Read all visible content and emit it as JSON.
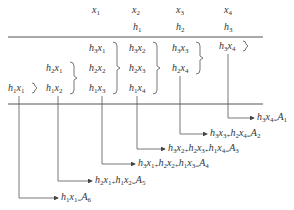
{
  "header": {
    "x_labels": [
      {
        "v": "x",
        "s": "1",
        "left": 92,
        "top": 5
      },
      {
        "v": "x",
        "s": "2",
        "left": 132,
        "top": 5
      },
      {
        "v": "x",
        "s": "3",
        "left": 176,
        "top": 5
      },
      {
        "v": "x",
        "s": "4",
        "left": 224,
        "top": 5
      }
    ],
    "h_labels": [
      {
        "v": "h",
        "s": "1",
        "left": 133,
        "top": 22
      },
      {
        "v": "h",
        "s": "2",
        "left": 176,
        "top": 22
      },
      {
        "v": "h",
        "s": "3",
        "left": 224,
        "top": 22
      }
    ]
  },
  "products": [
    {
      "left": 8,
      "top": 83,
      "items": [
        [
          "h",
          "1",
          "x",
          "1"
        ]
      ]
    },
    {
      "left": 46,
      "top": 63,
      "items": [
        [
          "h",
          "2",
          "x",
          "1"
        ],
        [
          "h",
          "1",
          "x",
          "2"
        ]
      ]
    },
    {
      "left": 89,
      "top": 43,
      "items": [
        [
          "h",
          "3",
          "x",
          "1"
        ],
        [
          "h",
          "2",
          "x",
          "2"
        ],
        [
          "h",
          "1",
          "x",
          "3"
        ]
      ]
    },
    {
      "left": 129,
      "top": 43,
      "items": [
        [
          "h",
          "3",
          "x",
          "2"
        ],
        [
          "h",
          "2",
          "x",
          "3"
        ],
        [
          "h",
          "1",
          "x",
          "4"
        ]
      ]
    },
    {
      "left": 172,
      "top": 43,
      "items": [
        [
          "h",
          "3",
          "x",
          "3"
        ],
        [
          "h",
          "2",
          "x",
          "4"
        ]
      ]
    },
    {
      "left": 219,
      "top": 41,
      "items": [
        [
          "h",
          "3",
          "x",
          "4"
        ]
      ]
    }
  ],
  "results": [
    {
      "text": "h3x4=A1",
      "left": 257,
      "top": 112,
      "vx": 228
    },
    {
      "text": "h3x3+h2x4=A2",
      "left": 210,
      "top": 128,
      "vx": 180
    },
    {
      "text": "h3x2+h2x3+h1x4=A3",
      "left": 168,
      "top": 143,
      "vx": 137
    },
    {
      "text": "h3x1+h2x2+h1x3=A4",
      "left": 138,
      "top": 158,
      "vx": 102
    },
    {
      "text": "h2x1+h1x2=A5",
      "left": 95,
      "top": 175,
      "vx": 58
    },
    {
      "text": "h1x1=A6",
      "left": 61,
      "top": 192,
      "vx": 19
    }
  ],
  "result_terms": [
    [
      [
        "h",
        "3",
        "x",
        "4"
      ]
    ],
    [
      [
        "h",
        "3",
        "x",
        "3"
      ],
      [
        "h",
        "2",
        "x",
        "4"
      ]
    ],
    [
      [
        "h",
        "3",
        "x",
        "2"
      ],
      [
        "h",
        "2",
        "x",
        "3"
      ],
      [
        "h",
        "1",
        "x",
        "4"
      ]
    ],
    [
      [
        "h",
        "3",
        "x",
        "1"
      ],
      [
        "h",
        "2",
        "x",
        "2"
      ],
      [
        "h",
        "1",
        "x",
        "3"
      ]
    ],
    [
      [
        "h",
        "2",
        "x",
        "1"
      ],
      [
        "h",
        "1",
        "x",
        "2"
      ]
    ],
    [
      [
        "h",
        "1",
        "x",
        "1"
      ]
    ]
  ],
  "result_labels": [
    "A1",
    "A2",
    "A3",
    "A4",
    "A5",
    "A6"
  ],
  "lines": {
    "top_y": 37,
    "bottom_y": 104,
    "x_start": 8,
    "x_end": 263
  },
  "colors": {
    "ink": "#333333",
    "line": "#555555"
  }
}
